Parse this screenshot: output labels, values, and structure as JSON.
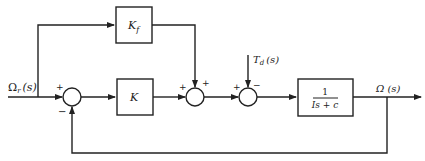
{
  "diagram": {
    "type": "block-diagram",
    "input_label": "Ω",
    "input_sub": "r",
    "input_arg": "(s)",
    "output_label": "Ω (s)",
    "disturbance_label": "T",
    "disturbance_sub": "d",
    "disturbance_arg": "(s)",
    "blocks": {
      "feedforward": {
        "main": "K",
        "sub": "f"
      },
      "controller": {
        "label": "K"
      },
      "plant": {
        "numerator": "1",
        "denominator": "Is + c"
      }
    },
    "summers": {
      "error": {
        "top_left_sign": "+",
        "bottom_sign": "−"
      },
      "combine": {
        "left_sign": "+",
        "top_sign": "+"
      },
      "disturbance": {
        "left_sign": "+",
        "top_sign": "−"
      }
    }
  }
}
